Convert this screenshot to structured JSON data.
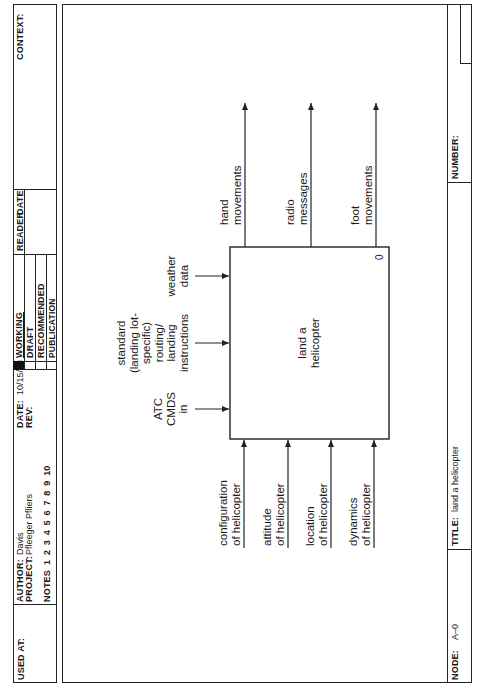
{
  "header": {
    "used_at_label": "USED AT:",
    "author_label": "AUTHOR:",
    "author": "Davis",
    "project_label": "PROJECT:",
    "project": "Pfleeger Pfliers",
    "notes_label": "NOTES",
    "notes_numbers": "1  2  3  4  5  6  7  8  9  10",
    "date_label": "DATE:",
    "date": "10/15/88",
    "rev_label": "REV:",
    "status": [
      "WORKING",
      "DRAFT",
      "RECOMMENDED",
      "PUBLICATION"
    ],
    "reader_label": "READER",
    "reader_date_label": "DATE",
    "context_label": "CONTEXT:"
  },
  "footer": {
    "node_label": "NODE:",
    "node": "A–0",
    "title_label": "TITLE:",
    "title": "land a helicopter",
    "number_label": "NUMBER:"
  },
  "diagram": {
    "box": {
      "label": "land a\nhelicopter",
      "number": "0"
    },
    "controls": [
      {
        "label": "ATC\nCMDS\nin"
      },
      {
        "label": "standard\n(landing lot-\nspecific)\nrouting/\nlanding\ninstructions"
      },
      {
        "label": "weather\ndata"
      }
    ],
    "inputs": [
      {
        "label": "configuration\nof helicopter"
      },
      {
        "label": "attitude\nof helicopter"
      },
      {
        "label": "location\nof helicopter"
      },
      {
        "label": "dynamics\nof helicopter"
      }
    ],
    "outputs": [
      {
        "label": "hand\nmovements"
      },
      {
        "label": "radio\nmessages"
      },
      {
        "label": "foot\nmovements"
      }
    ]
  }
}
